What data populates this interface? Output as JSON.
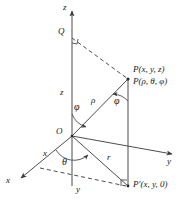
{
  "figure": {
    "background_color": "#ffffff",
    "line_color": "#4d4d4d",
    "text_color": "#1a1a1a",
    "width": 183,
    "height": 205
  },
  "axes": [
    {
      "name": "z-axis",
      "label": "z",
      "direction": "up",
      "tip": [
        72,
        8
      ],
      "label_pos": [
        63,
        4
      ]
    },
    {
      "name": "y-axis",
      "label": "y",
      "direction": "right",
      "tip": [
        176,
        155
      ],
      "label_pos": [
        168,
        158
      ]
    },
    {
      "name": "x-axis",
      "label": "x",
      "direction": "down-left",
      "tip": [
        17,
        180
      ],
      "label_pos": [
        7,
        178
      ]
    }
  ],
  "points": [
    {
      "name": "origin",
      "label": "O",
      "pos": [
        72,
        136
      ],
      "label_pos": [
        59,
        128
      ]
    },
    {
      "name": "point-q",
      "label": "Q",
      "pos": [
        72,
        38
      ],
      "label_pos": [
        58,
        30
      ]
    },
    {
      "name": "point-p",
      "label": "P(x, y, z)",
      "pos": [
        128,
        79
      ],
      "label_pos": [
        133,
        68
      ]
    },
    {
      "name": "point-p-spherical",
      "label": "P(ρ, θ, φ)",
      "pos": [
        128,
        79
      ],
      "label_pos": [
        133,
        79
      ]
    },
    {
      "name": "point-p-prime",
      "label": "P′(x, y, 0)",
      "pos": [
        128,
        186
      ],
      "label_pos": [
        133,
        181
      ]
    }
  ],
  "segments": [
    {
      "name": "segment-z",
      "label": "z",
      "label_pos": [
        61,
        91
      ]
    },
    {
      "name": "segment-rho",
      "label": "ρ",
      "label_pos": [
        93,
        100
      ]
    },
    {
      "name": "segment-r",
      "label": "r",
      "label_pos": [
        108,
        157
      ]
    },
    {
      "name": "segment-x",
      "label": "x",
      "label_pos": [
        44,
        152
      ]
    },
    {
      "name": "segment-y",
      "label": "y",
      "label_pos": [
        77,
        188
      ]
    }
  ],
  "angles": [
    {
      "name": "angle-phi-origin",
      "label": "φ",
      "label_pos": [
        76,
        106
      ]
    },
    {
      "name": "angle-phi-point",
      "label": "φ",
      "label_pos": [
        116,
        100
      ]
    },
    {
      "name": "angle-theta",
      "label": "θ",
      "label_pos": [
        63,
        161
      ]
    }
  ],
  "right_angles": [
    {
      "name": "right-angle-at-q",
      "pos": [
        72,
        38
      ]
    },
    {
      "name": "right-angle-at-p-prime",
      "pos": [
        128,
        186
      ]
    }
  ]
}
